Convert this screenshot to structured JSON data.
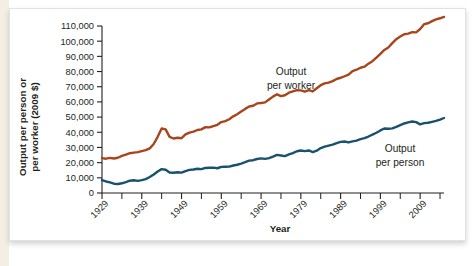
{
  "figure": {
    "background_color": "#ffffff",
    "page_margin_color": "#f3efe2",
    "border_color": "#e2e2e2"
  },
  "axis": {
    "y_title_line1": "Output per person or",
    "y_title_line2": "per worker (2009 $)",
    "x_title": "Year"
  },
  "labels": {
    "worker_line1": "Output",
    "worker_line2": "per worker",
    "person_line1": "Output",
    "person_line2": "per person"
  },
  "chart_data": {
    "type": "line",
    "title": "",
    "subtitle": "",
    "xlabel": "Year",
    "ylabel": "Output per person or per worker (2009 $)",
    "xlim": [
      1929,
      2015
    ],
    "ylim": [
      0,
      110000
    ],
    "grid": false,
    "legend": "inline-annotations",
    "x_tick_labels": [
      "1929",
      "1939",
      "1949",
      "1959",
      "1969",
      "1979",
      "1989",
      "1999",
      "2009"
    ],
    "x_tick_values": [
      1929,
      1939,
      1949,
      1959,
      1969,
      1979,
      1989,
      1999,
      2009
    ],
    "x_minor_tick_values": [
      1934,
      1944,
      1954,
      1964,
      1974,
      1984,
      1994,
      2004,
      2014
    ],
    "y_tick_labels": [
      "0",
      "10,000",
      "20,000",
      "30,000",
      "40,000",
      "50,000",
      "60,000",
      "70,000",
      "80,000",
      "90,000",
      "100,000",
      "110,000"
    ],
    "y_tick_values": [
      0,
      10000,
      20000,
      30000,
      40000,
      50000,
      60000,
      70000,
      80000,
      90000,
      100000,
      110000
    ],
    "x": [
      1929,
      1930,
      1931,
      1932,
      1933,
      1934,
      1935,
      1936,
      1937,
      1938,
      1939,
      1940,
      1941,
      1942,
      1943,
      1944,
      1945,
      1946,
      1947,
      1948,
      1949,
      1950,
      1951,
      1952,
      1953,
      1954,
      1955,
      1956,
      1957,
      1958,
      1959,
      1960,
      1961,
      1962,
      1963,
      1964,
      1965,
      1966,
      1967,
      1968,
      1969,
      1970,
      1971,
      1972,
      1973,
      1974,
      1975,
      1976,
      1977,
      1978,
      1979,
      1980,
      1981,
      1982,
      1983,
      1984,
      1985,
      1986,
      1987,
      1988,
      1989,
      1990,
      1991,
      1992,
      1993,
      1994,
      1995,
      1996,
      1997,
      1998,
      1999,
      2000,
      2001,
      2002,
      2003,
      2004,
      2005,
      2006,
      2007,
      2008,
      2009,
      2010,
      2011,
      2012,
      2013,
      2014,
      2015
    ],
    "series": [
      {
        "name": "Output per worker",
        "color": "#A8451A",
        "label_position": "above-line-center",
        "values": [
          23000,
          22600,
          23100,
          22700,
          23200,
          24400,
          25300,
          26200,
          26600,
          26900,
          27600,
          28200,
          29400,
          32300,
          37000,
          42500,
          41900,
          37000,
          35900,
          36400,
          36100,
          38600,
          39800,
          40400,
          41500,
          41900,
          43400,
          43200,
          44100,
          44900,
          46700,
          47300,
          48600,
          50500,
          51900,
          53700,
          55400,
          57000,
          57500,
          59000,
          59300,
          59700,
          61600,
          63500,
          65000,
          63800,
          64400,
          66100,
          66900,
          67700,
          67600,
          66800,
          67800,
          66900,
          69000,
          71000,
          72200,
          72700,
          73700,
          75100,
          75900,
          76900,
          78000,
          80300,
          81200,
          82500,
          83200,
          85200,
          86800,
          89200,
          91700,
          94200,
          95800,
          98700,
          101300,
          103100,
          104600,
          105000,
          105900,
          105800,
          108000,
          111200,
          111800,
          113200,
          114300,
          115100,
          116000
        ]
      },
      {
        "name": "Output per person",
        "color": "#18526E",
        "label_position": "below-line-right",
        "values": [
          8500,
          7600,
          7000,
          6100,
          5900,
          6400,
          7200,
          8100,
          8400,
          8000,
          8500,
          9100,
          10500,
          12200,
          14200,
          15700,
          15300,
          13500,
          13300,
          13700,
          13400,
          14400,
          15200,
          15500,
          16000,
          15700,
          16500,
          16600,
          16700,
          16300,
          17200,
          17300,
          17400,
          18100,
          18600,
          19400,
          20300,
          21300,
          21600,
          22400,
          22800,
          22500,
          23000,
          24000,
          25100,
          24700,
          24300,
          25400,
          26300,
          27500,
          28000,
          27600,
          28000,
          27000,
          27900,
          29600,
          30500,
          31200,
          31900,
          32900,
          33700,
          33900,
          33300,
          34000,
          34500,
          35500,
          36100,
          37200,
          38400,
          39700,
          41200,
          42500,
          42300,
          42600,
          43500,
          44700,
          45800,
          46500,
          47100,
          46700,
          45200,
          46000,
          46300,
          46900,
          47500,
          48400,
          49400
        ]
      }
    ]
  }
}
